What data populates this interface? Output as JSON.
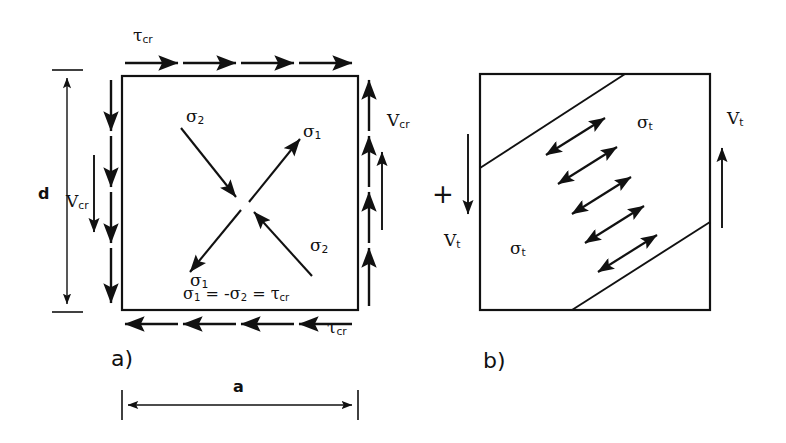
{
  "figure": {
    "type": "engineering-diagram",
    "stroke_color": "#111111",
    "background_color": "#ffffff",
    "operator": "+"
  },
  "panel_a": {
    "tag": "a)",
    "shear_stress_top": "τ",
    "shear_stress_top_sub": "cr",
    "shear_stress_bottom": "τ",
    "shear_stress_bottom_sub": "cr",
    "shear_force_left": "V",
    "shear_force_left_sub": "cr",
    "shear_force_right": "V",
    "shear_force_right_sub": "cr",
    "principal_tension_upper_right": "σ",
    "principal_tension_upper_right_sub": "1",
    "principal_tension_lower_left": "σ",
    "principal_tension_lower_left_sub": "1",
    "principal_compression_upper_left": "σ",
    "principal_compression_upper_left_sub": "2",
    "principal_compression_lower_right": "σ",
    "principal_compression_lower_right_sub": "2",
    "formula_parts": [
      "σ",
      "1",
      " = -",
      "σ",
      "2",
      " = ",
      "τ",
      "cr"
    ],
    "dimension_height": "d",
    "dimension_width": "a",
    "top_arrow_count": 4,
    "bottom_arrow_count": 4,
    "left_arrow_count": 4,
    "right_arrow_count": 4,
    "top_arrow_direction": "right",
    "bottom_arrow_direction": "left",
    "left_arrow_direction": "down",
    "right_arrow_direction": "up"
  },
  "panel_b": {
    "tag": "b)",
    "tension_field_stress_upper": "σ",
    "tension_field_stress_upper_sub": "t",
    "tension_field_stress_lower": "σ",
    "tension_field_stress_lower_sub": "t",
    "shear_force_left": "V",
    "shear_force_left_sub": "t",
    "shear_force_right": "V",
    "shear_force_right_sub": "t",
    "left_arrow_direction": "down",
    "right_arrow_direction": "up",
    "diagonal_band_count": 2,
    "tension_arrow_count": 5,
    "tension_arrow_style": "double-headed",
    "tension_field_angle_deg": 35
  }
}
